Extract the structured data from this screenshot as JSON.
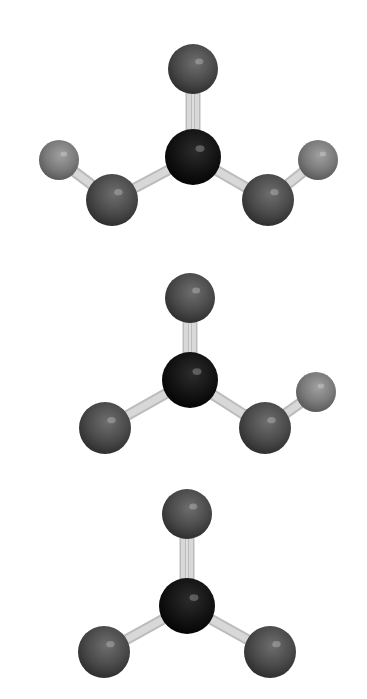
{
  "figure": {
    "type": "ball-and-stick molecular models",
    "background": "#ffffff",
    "colors": {
      "oxygen": "#4a4a4a",
      "carbon": "#111111",
      "hydrogen": "#7a7a7a",
      "bond": "#d8d8d8"
    },
    "molecules": [
      {
        "id": "carbonic-acid",
        "formula": "H2CO3",
        "atoms": [
          {
            "el": "O",
            "x": 193,
            "y": 69,
            "r": 25
          },
          {
            "el": "C",
            "x": 193,
            "y": 157,
            "r": 28
          },
          {
            "el": "O",
            "x": 112,
            "y": 200,
            "r": 26
          },
          {
            "el": "O",
            "x": 268,
            "y": 200,
            "r": 26
          },
          {
            "el": "H",
            "x": 59,
            "y": 160,
            "r": 20
          },
          {
            "el": "H",
            "x": 318,
            "y": 160,
            "r": 20
          }
        ],
        "bonds": [
          [
            0,
            1,
            2
          ],
          [
            1,
            2,
            1
          ],
          [
            1,
            3,
            1
          ],
          [
            2,
            4,
            1
          ],
          [
            3,
            5,
            1
          ]
        ]
      },
      {
        "id": "bicarbonate",
        "formula": "HCO3-",
        "atoms": [
          {
            "el": "O",
            "x": 190,
            "y": 298,
            "r": 25
          },
          {
            "el": "C",
            "x": 190,
            "y": 380,
            "r": 28
          },
          {
            "el": "O",
            "x": 105,
            "y": 428,
            "r": 26
          },
          {
            "el": "O",
            "x": 265,
            "y": 428,
            "r": 26
          },
          {
            "el": "H",
            "x": 316,
            "y": 392,
            "r": 20
          }
        ],
        "bonds": [
          [
            0,
            1,
            2
          ],
          [
            1,
            2,
            1
          ],
          [
            1,
            3,
            1
          ],
          [
            3,
            4,
            1
          ]
        ]
      },
      {
        "id": "carbonate",
        "formula": "CO3 2-",
        "atoms": [
          {
            "el": "O",
            "x": 187,
            "y": 514,
            "r": 25
          },
          {
            "el": "C",
            "x": 187,
            "y": 606,
            "r": 28
          },
          {
            "el": "O",
            "x": 104,
            "y": 652,
            "r": 26
          },
          {
            "el": "O",
            "x": 270,
            "y": 652,
            "r": 26
          }
        ],
        "bonds": [
          [
            0,
            1,
            2
          ],
          [
            1,
            2,
            1
          ],
          [
            1,
            3,
            1
          ]
        ]
      }
    ]
  }
}
